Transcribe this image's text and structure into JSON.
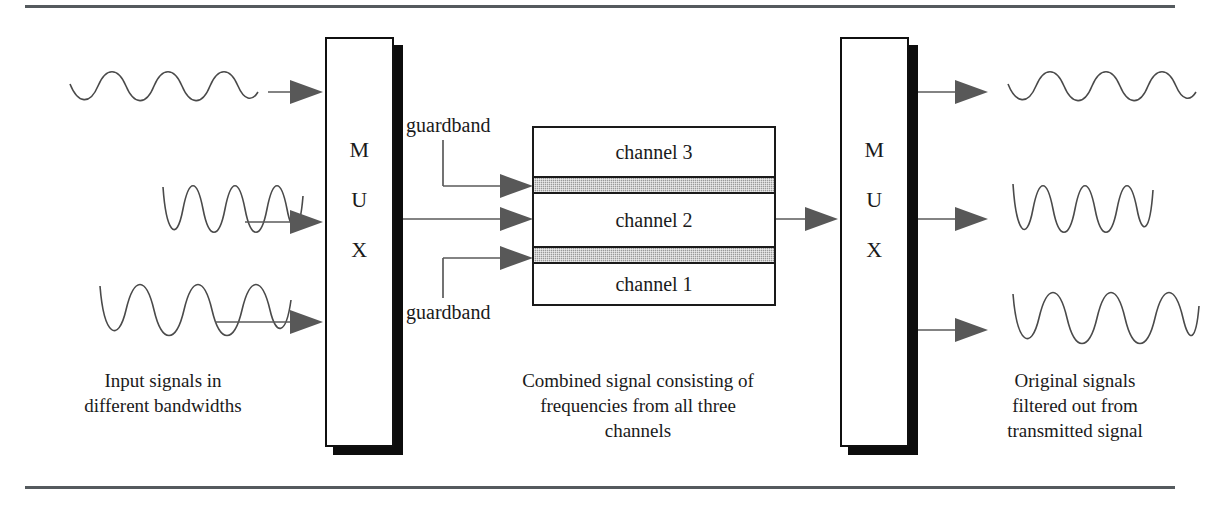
{
  "figure": {
    "title_visible": false,
    "type": "fdm-multiplexing-diagram"
  },
  "mux_left": {
    "name": "MUX",
    "letters": [
      "M",
      "U",
      "X"
    ]
  },
  "mux_right": {
    "name": "MUX",
    "letters": [
      "M",
      "U",
      "X"
    ]
  },
  "channel_box": {
    "rows": [
      {
        "id": "channel3",
        "label": "channel 3",
        "kind": "channel"
      },
      {
        "id": "guardband_upper",
        "label": "",
        "kind": "guardband"
      },
      {
        "id": "channel2",
        "label": "channel 2",
        "kind": "channel"
      },
      {
        "id": "guardband_lower",
        "label": "",
        "kind": "guardband"
      },
      {
        "id": "channel1",
        "label": "channel 1",
        "kind": "channel"
      }
    ]
  },
  "annotations": {
    "guardband_top_label": "guardband",
    "guardband_bottom_label": "guardband"
  },
  "captions": {
    "left": "Input signals in\ndifferent bandwidths",
    "middle": "Combined signal consisting of\nfrequencies from all three\nchannels",
    "right": "Original signals\nfiltered out from\ntransmitted signal"
  },
  "waveforms": {
    "input": [
      {
        "id": "input-wave-1",
        "cycles": 4,
        "amplitude": "low",
        "description": "low amplitude sine wave"
      },
      {
        "id": "input-wave-2",
        "cycles": 4,
        "amplitude": "high",
        "description": "high frequency narrow sine wave"
      },
      {
        "id": "input-wave-3",
        "cycles": 4,
        "amplitude": "high",
        "description": "high amplitude medium frequency sine wave"
      }
    ],
    "output": [
      {
        "id": "output-wave-1",
        "cycles": 4,
        "amplitude": "low",
        "description": "low amplitude sine wave"
      },
      {
        "id": "output-wave-2",
        "cycles": 4,
        "amplitude": "high",
        "description": "high frequency narrow sine wave"
      },
      {
        "id": "output-wave-3",
        "cycles": 4,
        "amplitude": "high",
        "description": "high amplitude medium frequency sine wave"
      }
    ]
  },
  "colors": {
    "line": "#4a4a4a",
    "arrow_fill": "#585858",
    "guardband_fill": "#9a9a9a",
    "box_stroke": "#1a1a1a",
    "shadow": "#0d0d0d",
    "rule": "#555a5e",
    "page_background": "#ffffff"
  },
  "rules": {
    "top": "horizontal-rule",
    "bottom": "horizontal-rule"
  }
}
